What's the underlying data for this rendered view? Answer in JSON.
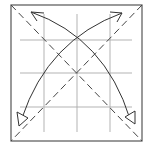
{
  "diagram": {
    "type": "origami-fold-diagram",
    "colors": {
      "background": "#ffffff",
      "border": "#555555",
      "grid": "#aaaaaa",
      "dashed": "#444444",
      "arrow": "#333333"
    },
    "square": {
      "x1": 11,
      "y1": 5,
      "x2": 142,
      "y2": 141
    },
    "grid": {
      "vertical_x": [
        44,
        77,
        110
      ],
      "horizontal_y": [
        40,
        73,
        107
      ],
      "extent": {
        "x1": 20,
        "y1": 14,
        "x2": 132,
        "y2": 132
      }
    },
    "dashed_diagonals": [
      {
        "name": "diagonal-tl-br",
        "x1": 11,
        "y1": 5,
        "x2": 142,
        "y2": 141
      },
      {
        "name": "diagonal-tr-bl",
        "x1": 142,
        "y1": 5,
        "x2": 11,
        "y2": 141
      }
    ],
    "arrows": [
      {
        "name": "arrow-bl-to-tr",
        "path": "M22 118 Q 48 40 122 13",
        "head_open": {
          "tip": [
            122,
            13
          ],
          "a": [
            110,
            12
          ],
          "b": [
            117,
            22
          ]
        },
        "head_hollow": {
          "points": "17,112 28,118 19,126"
        }
      },
      {
        "name": "arrow-tl-to-br",
        "path": "M31 12 Q 105 38 130 119",
        "head_open": {
          "tip": [
            31,
            12
          ],
          "a": [
            44,
            13
          ],
          "b": [
            37,
            21
          ]
        },
        "head_hollow": {
          "points": "125,117 135,111 135,124"
        }
      }
    ]
  }
}
